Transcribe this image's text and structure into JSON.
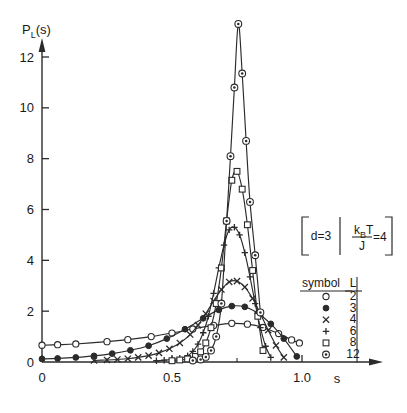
{
  "figure": {
    "y_axis_label": "P",
    "y_axis_label_sub": "L",
    "y_axis_label_tail": "(s)",
    "x_axis_label": "s"
  },
  "axes": {
    "x_ticks": [
      "0",
      "0.5",
      "1.0"
    ],
    "x_tick_values": [
      0,
      0.5,
      1.0
    ],
    "x_minor_values": [
      0.25,
      0.75
    ],
    "y_ticks": [
      "0",
      "2",
      "4",
      "6",
      "8",
      "10",
      "12"
    ],
    "y_tick_values": [
      0,
      2,
      4,
      6,
      8,
      10,
      12
    ],
    "xlim": [
      0,
      1.12
    ],
    "ylim": [
      0,
      13.8
    ]
  },
  "param_box": {
    "left": "d=3",
    "numerator": "k",
    "numerator_sub": "B",
    "numerator_tail": "T",
    "denominator": "J",
    "equals": "=4"
  },
  "legend": {
    "header_symbol": "symbol",
    "header_L": "L",
    "rows": [
      {
        "symbol": "open-circle",
        "L": "2"
      },
      {
        "symbol": "filled-circle",
        "L": "3"
      },
      {
        "symbol": "cross",
        "L": "4"
      },
      {
        "symbol": "plus",
        "L": "6"
      },
      {
        "symbol": "open-square",
        "L": "8"
      },
      {
        "symbol": "dotted-circle",
        "L": "12"
      }
    ]
  },
  "chart_data": {
    "type": "line",
    "title": "",
    "xlabel": "s",
    "ylabel": "P_L(s)",
    "xlim": [
      0,
      1.12
    ],
    "ylim": [
      0,
      13.8
    ],
    "grid": false,
    "legend_position": "right",
    "annotations": [
      "d=3",
      "k_B T / J = 4"
    ],
    "series": [
      {
        "name": "L = 2",
        "marker": "open-circle",
        "x": [
          0.0,
          0.06,
          0.13,
          0.25,
          0.33,
          0.42,
          0.5,
          0.58,
          0.66,
          0.73,
          0.79,
          0.85,
          0.91,
          0.96,
          0.99
        ],
        "y": [
          0.66,
          0.68,
          0.71,
          0.8,
          0.88,
          1.0,
          1.14,
          1.3,
          1.44,
          1.52,
          1.49,
          1.36,
          1.12,
          0.87,
          0.75
        ]
      },
      {
        "name": "L = 3",
        "marker": "filled-circle",
        "x": [
          0.0,
          0.06,
          0.13,
          0.2,
          0.27,
          0.34,
          0.41,
          0.48,
          0.55,
          0.62,
          0.68,
          0.73,
          0.78,
          0.83,
          0.88,
          0.93,
          0.98
        ],
        "y": [
          0.12,
          0.14,
          0.18,
          0.24,
          0.33,
          0.46,
          0.64,
          0.92,
          1.29,
          1.72,
          2.05,
          2.2,
          2.17,
          1.92,
          1.5,
          0.92,
          0.22
        ]
      },
      {
        "name": "L = 4",
        "marker": "cross",
        "x": [
          0.2,
          0.25,
          0.29,
          0.33,
          0.37,
          0.41,
          0.45,
          0.49,
          0.53,
          0.57,
          0.6,
          0.63,
          0.66,
          0.69,
          0.72,
          0.75,
          0.78,
          0.81,
          0.84,
          0.87,
          0.9,
          0.93
        ],
        "y": [
          0.06,
          0.08,
          0.1,
          0.13,
          0.18,
          0.25,
          0.36,
          0.52,
          0.75,
          1.08,
          1.45,
          1.9,
          2.4,
          2.85,
          3.15,
          3.18,
          2.95,
          2.5,
          1.9,
          1.25,
          0.65,
          0.18
        ]
      },
      {
        "name": "L = 6",
        "marker": "plus",
        "x": [
          0.44,
          0.47,
          0.5,
          0.53,
          0.56,
          0.58,
          0.6,
          0.62,
          0.64,
          0.66,
          0.68,
          0.7,
          0.72,
          0.74,
          0.76,
          0.78,
          0.8,
          0.82,
          0.84,
          0.86,
          0.88
        ],
        "y": [
          0.05,
          0.07,
          0.1,
          0.15,
          0.25,
          0.42,
          0.7,
          1.15,
          1.8,
          2.7,
          3.7,
          4.6,
          5.2,
          5.3,
          5.0,
          4.3,
          3.35,
          2.3,
          1.35,
          0.62,
          0.18
        ]
      },
      {
        "name": "L = 8",
        "marker": "open-square",
        "x": [
          0.5,
          0.53,
          0.56,
          0.59,
          0.61,
          0.63,
          0.65,
          0.67,
          0.69,
          0.71,
          0.73,
          0.75,
          0.77,
          0.79,
          0.81,
          0.83,
          0.85
        ],
        "y": [
          0.05,
          0.08,
          0.12,
          0.22,
          0.4,
          0.75,
          1.35,
          2.3,
          3.7,
          5.55,
          7.15,
          7.5,
          6.8,
          5.4,
          3.6,
          1.8,
          0.45
        ]
      },
      {
        "name": "L = 12",
        "marker": "dotted-circle",
        "x": [
          0.58,
          0.61,
          0.63,
          0.65,
          0.67,
          0.69,
          0.71,
          0.725,
          0.74,
          0.755,
          0.77,
          0.785,
          0.8,
          0.82,
          0.84
        ],
        "y": [
          0.06,
          0.1,
          0.2,
          0.45,
          1.0,
          2.3,
          5.55,
          8.1,
          10.8,
          13.3,
          11.35,
          8.7,
          6.3,
          4.2,
          1.95
        ]
      }
    ]
  }
}
